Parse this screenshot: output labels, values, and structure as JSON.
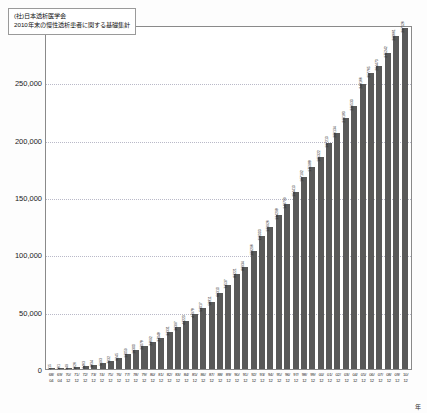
{
  "chart_data": {
    "type": "bar",
    "title": "(社)日本透析医学会 2010年末の慢性透析患者に関する基礎集計",
    "title_lines": [
      "(社)日本透析医学会",
      "2010年末の慢性透析患者に関する基礎集計"
    ],
    "ylabel": "人",
    "xlabel": "年",
    "ylim": [
      0,
      300000
    ],
    "yticks": [
      0,
      50000,
      100000,
      150000,
      200000,
      250000,
      300000
    ],
    "ytick_labels": [
      "0",
      "50,000",
      "100,000",
      "150,000",
      "200,000",
      "250,000",
      "300,000"
    ],
    "grid": true,
    "legend": "none",
    "bar_color": "#595959",
    "categories": [
      "68/04",
      "69/04",
      "70/12",
      "71/12",
      "72/12",
      "73/12",
      "74/12",
      "75/12",
      "76/12",
      "77/12",
      "78/12",
      "79/12",
      "80/12",
      "81/12",
      "82/12",
      "83/12",
      "84/12",
      "85/12",
      "86/12",
      "87/12",
      "88/12",
      "89/12",
      "90/12",
      "91/12",
      "92/12",
      "93/12",
      "94/12",
      "95/12",
      "96/12",
      "97/12",
      "98/12",
      "99/12",
      "00/12",
      "01/12",
      "02/12",
      "03/12",
      "04/12",
      "05/12",
      "06/12",
      "07/12",
      "08/12",
      "09/12",
      "10/12"
    ],
    "year_labels": [
      "68/",
      "69/",
      "70/",
      "71/",
      "72/",
      "73/",
      "74/",
      "75/",
      "76/",
      "77/",
      "78/",
      "79/",
      "80/",
      "81/",
      "82/",
      "83/",
      "84/",
      "85/",
      "86/",
      "87/",
      "88/",
      "89/",
      "90/",
      "91/",
      "92/",
      "93/",
      "94/",
      "95/",
      "96/",
      "97/",
      "98/",
      "99/",
      "00/",
      "01/",
      "02/",
      "03/",
      "04/",
      "05/",
      "06/",
      "07/",
      "08/",
      "09/",
      "10/"
    ],
    "month_labels": [
      "04",
      "04",
      "12",
      "12",
      "12",
      "12",
      "12",
      "12",
      "12",
      "12",
      "12",
      "12",
      "12",
      "12",
      "12",
      "12",
      "12",
      "12",
      "12",
      "12",
      "12",
      "12",
      "12",
      "12",
      "12",
      "12",
      "12",
      "12",
      "12",
      "12",
      "12",
      "12",
      "12",
      "12",
      "12",
      "12",
      "12",
      "12",
      "12",
      "12",
      "12",
      "12",
      "12"
    ],
    "values": [
      215,
      361,
      949,
      1626,
      2463,
      3834,
      5193,
      7332,
      9245,
      13059,
      16300,
      20078,
      23692,
      27048,
      32331,
      36397,
      42223,
      47978,
      53017,
      58811,
      66310,
      73537,
      83221,
      88934,
      103296,
      116303,
      123926,
      134298,
      143709,
      154413,
      167192,
      175988,
      185322,
      197213,
      206134,
      219183,
      229533,
      248166,
      257765,
      264473,
      275242,
      290661,
      297126
    ],
    "value_labels": [
      "215",
      "361",
      "949",
      "1626",
      "2463",
      "3834",
      "5193",
      "7332",
      "9245",
      "13059",
      "16300",
      "20078",
      "23692",
      "27048",
      "32331",
      "36397",
      "42223",
      "47978",
      "53017",
      "58811",
      "66310",
      "73537",
      "83221",
      "88934",
      "103296",
      "116303",
      "123926",
      "134298",
      "143709",
      "154413",
      "167192",
      "175988",
      "185322",
      "197213",
      "206134",
      "219183",
      "229533",
      "248166",
      "257765",
      "264473",
      "275242",
      "290661",
      "297126"
    ]
  }
}
